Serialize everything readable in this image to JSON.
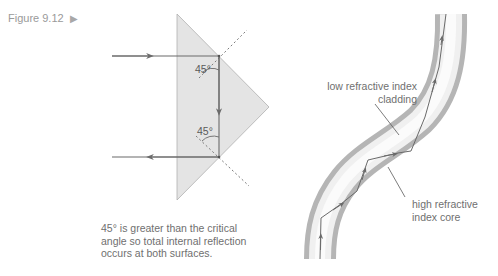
{
  "figure": {
    "label": "Figure 9.12",
    "marker": "▶"
  },
  "prism_diagram": {
    "angle_top": "45°",
    "angle_bottom": "45°",
    "caption": "45° is greater than the critical angle so total internal reflection occurs at both surfaces."
  },
  "fibre_diagram": {
    "cladding_label": "low refractive index cladding",
    "core_label": "high refractive index core"
  },
  "colors": {
    "prism_fill": "#e4e4e4",
    "prism_edge": "#a0a0a0",
    "ray": "#707070",
    "cladding": "#b8b8b8",
    "core": "#f2f2f2",
    "text": "#6f6f6f"
  }
}
